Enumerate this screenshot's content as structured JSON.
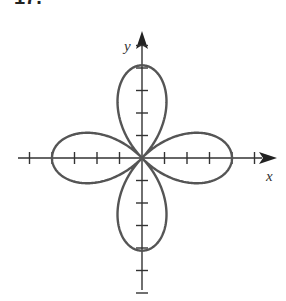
{
  "problem": {
    "number": "17."
  },
  "figure": {
    "type": "polar-rose",
    "equation_form": "r = 4 cos(2θ)",
    "petals": 4,
    "petal_length_units": 4,
    "axes": {
      "x_label": "x",
      "y_label": "y",
      "x_ticks": [
        -5,
        -4,
        -3,
        -2,
        -1,
        1,
        2,
        3,
        4,
        5
      ],
      "y_ticks": [
        -6,
        -5,
        -4,
        -3,
        -2,
        -1,
        1,
        2,
        3,
        4,
        5
      ]
    },
    "colors": {
      "axis": "#333333",
      "curve": "#555555"
    }
  }
}
